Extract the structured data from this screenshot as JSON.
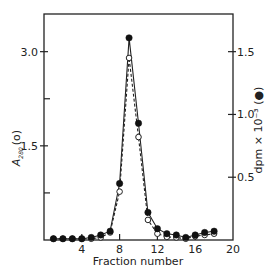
{
  "chart_data": {
    "type": "line",
    "title": "",
    "xlabel": "Fraction number",
    "ylabel_left": "A",
    "ylabel_left_subscript": "280",
    "ylabel_left_suffix": "(o)",
    "ylabel_right": "dpm × 10⁻³ (●)",
    "xlim": [
      0,
      20
    ],
    "ylim_left": [
      0,
      3.6
    ],
    "ylim_right": [
      0,
      1.8
    ],
    "x_ticks": [
      4,
      8,
      12,
      16,
      20
    ],
    "x_tick_labels": [
      "4",
      "8",
      "12",
      "16",
      "20"
    ],
    "y_left_ticks": [
      1.5,
      3.0
    ],
    "y_left_tick_labels": [
      "1.5",
      "3.0"
    ],
    "y_left_minor_ticks": [
      0.75,
      2.25
    ],
    "y_right_ticks": [
      0.5,
      1.0,
      1.5
    ],
    "y_right_tick_labels": [
      "0.5",
      "1.0",
      "1.5"
    ],
    "grid": false,
    "legend": "none",
    "x": [
      1,
      2,
      3,
      4,
      5,
      6,
      7,
      8,
      9,
      10,
      11,
      12,
      13,
      14,
      15,
      16,
      17,
      18
    ],
    "series": [
      {
        "name": "A280 (open circles)",
        "axis": "left",
        "marker": "open-circle",
        "line": "dashed",
        "values": [
          0.02,
          0.02,
          0.02,
          0.02,
          0.02,
          0.04,
          0.12,
          0.77,
          2.9,
          1.64,
          0.32,
          0.1,
          0.05,
          0.04,
          0.02,
          0.06,
          0.08,
          0.1
        ]
      },
      {
        "name": "dpm x 10^-3 (filled circles)",
        "axis": "right",
        "marker": "filled-circle",
        "line": "solid",
        "values": [
          0.01,
          0.01,
          0.01,
          0.01,
          0.02,
          0.04,
          0.07,
          0.45,
          1.61,
          0.93,
          0.22,
          0.09,
          0.05,
          0.04,
          0.02,
          0.04,
          0.06,
          0.07
        ]
      }
    ]
  }
}
